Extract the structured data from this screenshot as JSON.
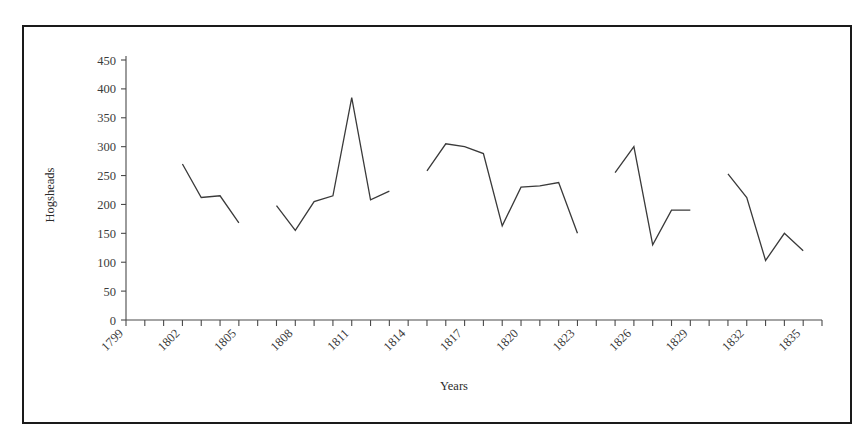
{
  "chart_data": {
    "type": "line",
    "title": "",
    "subtitle": "",
    "xlabel": "Years",
    "ylabel": "Hogsheads",
    "xlim": [
      1799,
      1836
    ],
    "ylim": [
      0,
      450
    ],
    "ytick_step": 50,
    "yticks": [
      0,
      50,
      100,
      150,
      200,
      250,
      300,
      350,
      400,
      450
    ],
    "ytick_labels": [
      "0",
      "50",
      "100",
      "150",
      "200",
      "250",
      "300",
      "350",
      "400",
      "450"
    ],
    "xticks": [
      1799,
      1800,
      1801,
      1802,
      1803,
      1804,
      1805,
      1806,
      1807,
      1808,
      1809,
      1810,
      1811,
      1812,
      1813,
      1814,
      1815,
      1816,
      1817,
      1818,
      1819,
      1820,
      1821,
      1822,
      1823,
      1824,
      1825,
      1826,
      1827,
      1828,
      1829,
      1830,
      1831,
      1832,
      1833,
      1834,
      1835,
      1836
    ],
    "xtick_labels_shown": [
      "1799",
      "1802",
      "1805",
      "1808",
      "1811",
      "1814",
      "1817",
      "1820",
      "1823",
      "1826",
      "1829",
      "1832",
      "1835"
    ],
    "xtick_label_step": 3,
    "xtick_label_rotation": 45,
    "grid": false,
    "legend": false,
    "legend_position": "none",
    "line_color": "#3a3a3a",
    "axis_color": "#4a4a4a",
    "border_color": "#1a1a1a",
    "background_color": "#ffffff",
    "markers": false,
    "series": [
      {
        "name": "Hogsheads",
        "x": [
          1802,
          1803,
          1804,
          1805,
          1807,
          1808,
          1809,
          1810,
          1811,
          1812,
          1813,
          1815,
          1816,
          1817,
          1818,
          1819,
          1820,
          1821,
          1822,
          1823,
          1825,
          1826,
          1827,
          1828,
          1829,
          1831,
          1832,
          1833,
          1834,
          1835
        ],
        "y": [
          270,
          212,
          215,
          168,
          198,
          155,
          205,
          215,
          385,
          208,
          223,
          258,
          305,
          300,
          288,
          163,
          230,
          232,
          238,
          150,
          255,
          300,
          130,
          190,
          190,
          253,
          212,
          103,
          150,
          120
        ],
        "breaks_after_x": [
          1805,
          1813,
          1823,
          1829
        ]
      }
    ],
    "segments": [
      {
        "points": [
          [
            1802,
            270
          ],
          [
            1803,
            212
          ],
          [
            1804,
            215
          ],
          [
            1805,
            168
          ]
        ]
      },
      {
        "points": [
          [
            1807,
            198
          ],
          [
            1808,
            155
          ],
          [
            1809,
            205
          ],
          [
            1810,
            215
          ],
          [
            1811,
            385
          ],
          [
            1812,
            208
          ],
          [
            1813,
            223
          ]
        ]
      },
      {
        "points": [
          [
            1815,
            258
          ],
          [
            1816,
            305
          ],
          [
            1817,
            300
          ],
          [
            1818,
            288
          ],
          [
            1819,
            163
          ],
          [
            1820,
            230
          ],
          [
            1821,
            232
          ],
          [
            1822,
            238
          ],
          [
            1823,
            150
          ]
        ]
      },
      {
        "points": [
          [
            1825,
            255
          ],
          [
            1826,
            300
          ],
          [
            1827,
            130
          ],
          [
            1828,
            190
          ],
          [
            1829,
            190
          ]
        ]
      },
      {
        "points": [
          [
            1831,
            253
          ],
          [
            1832,
            212
          ],
          [
            1833,
            103
          ],
          [
            1834,
            150
          ],
          [
            1835,
            120
          ]
        ]
      }
    ]
  }
}
